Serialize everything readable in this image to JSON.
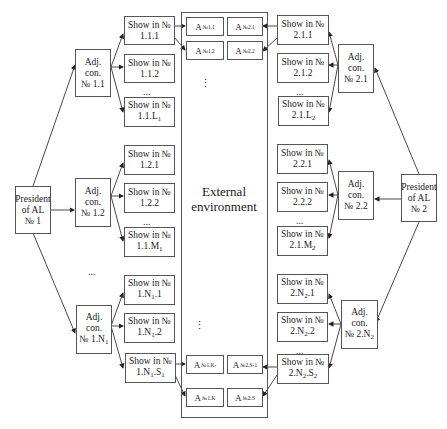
{
  "environment": {
    "label_line1": "External",
    "label_line2": "environment"
  },
  "presidents": [
    {
      "id": "president-1",
      "line1": "President",
      "line2": "of AL",
      "line3": "№ 1"
    },
    {
      "id": "president-2",
      "line1": "President",
      "line2": "of AL",
      "line3": "№ 2"
    }
  ],
  "left": {
    "adj": [
      {
        "line1": "Adj. con.",
        "line2": "№ 1.1"
      },
      {
        "line1": "Adj. con.",
        "line2": "№ 1.2"
      },
      {
        "line1": "Adj. con.",
        "line2": "№ 1.N",
        "sub": "1"
      }
    ],
    "shows": [
      {
        "line1": "Show in №",
        "line2": "1.1.1",
        "sub": "",
        "tail": ""
      },
      {
        "line1": "Show in №",
        "line2": "1.1.2",
        "sub": "",
        "tail": ""
      },
      {
        "line1": "Show in №",
        "line2": "1.1.L",
        "sub": "1",
        "tail": ""
      },
      {
        "line1": "Show in №",
        "line2": "1.2.1",
        "sub": "",
        "tail": ""
      },
      {
        "line1": "Show in №",
        "line2": "1.2.2",
        "sub": "",
        "tail": ""
      },
      {
        "line1": "Show in №",
        "line2": "1.1.M",
        "sub": "1",
        "tail": ""
      },
      {
        "line1": "Show in №",
        "line2": "1.N",
        "sub": "1",
        "tail": ".1"
      },
      {
        "line1": "Show in №",
        "line2": "1.N",
        "sub": "1",
        "tail": ".2"
      },
      {
        "line1": "Show in №",
        "line2": "1.N",
        "sub": "1",
        "tail": ".S",
        "sub2": "1"
      }
    ]
  },
  "right": {
    "adj": [
      {
        "line1": "Adj. con.",
        "line2": "№ 2.1"
      },
      {
        "line1": "Adj. con.",
        "line2": "№ 2.2"
      },
      {
        "line1": "Adj. con.",
        "line2": "№ 2.N",
        "sub": "2"
      }
    ],
    "shows": [
      {
        "line1": "Show in №",
        "line2": "2.1.1",
        "sub": "",
        "tail": ""
      },
      {
        "line1": "Show in №",
        "line2": "2.1.2",
        "sub": "",
        "tail": ""
      },
      {
        "line1": "Show in №",
        "line2": "2.1.L",
        "sub": "2",
        "tail": ""
      },
      {
        "line1": "Show in №",
        "line2": "2.2.1",
        "sub": "",
        "tail": ""
      },
      {
        "line1": "Show in №",
        "line2": "2.2.2",
        "sub": "",
        "tail": ""
      },
      {
        "line1": "Show in №",
        "line2": "2.1.M",
        "sub": "2",
        "tail": ""
      },
      {
        "line1": "Show in №",
        "line2": "2.N",
        "sub": "2",
        "tail": ".1"
      },
      {
        "line1": "Show in №",
        "line2": "2.N",
        "sub": "2",
        "tail": ".2"
      },
      {
        "line1": "Show in №",
        "line2": "2.N",
        "sub": "2",
        "tail": ".S",
        "sub2": "2"
      }
    ]
  },
  "agents": {
    "top": [
      {
        "base": "A",
        "sub": "№1.1"
      },
      {
        "base": "A",
        "sub": "№2.1"
      },
      {
        "base": "A",
        "sub": "№1.2"
      },
      {
        "base": "A",
        "sub": "№2.2"
      }
    ],
    "bottom": [
      {
        "base": "A",
        "sub": "№1.K-"
      },
      {
        "base": "A",
        "sub": "№2.S-1"
      },
      {
        "base": "A",
        "sub": "№1.K"
      },
      {
        "base": "A",
        "sub": "№2.S"
      }
    ]
  },
  "ellipsis": {
    "h": "...",
    "v": "⋮"
  }
}
